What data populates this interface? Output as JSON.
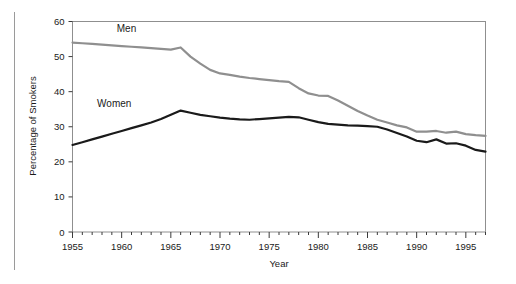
{
  "chart_data": {
    "type": "line",
    "title": "",
    "xlabel": "Year",
    "ylabel": "Percentage of Smokers",
    "xlim": [
      1955,
      1997
    ],
    "ylim": [
      0,
      60
    ],
    "xticks": [
      1955,
      1960,
      1965,
      1970,
      1975,
      1980,
      1985,
      1990,
      1995
    ],
    "xtick_labels": [
      "1955",
      "1960",
      "1965",
      "1970",
      "1975",
      "1980",
      "1985",
      "1990",
      "1995"
    ],
    "yticks": [
      0,
      10,
      20,
      30,
      40,
      50,
      60
    ],
    "ytick_labels": [
      "0",
      "10",
      "20",
      "30",
      "40",
      "50",
      "60"
    ],
    "minor_xtick_interval": 1,
    "grid": false,
    "legend": "inline-labels",
    "x": [
      1955,
      1956,
      1957,
      1958,
      1959,
      1960,
      1961,
      1962,
      1963,
      1964,
      1965,
      1966,
      1967,
      1968,
      1969,
      1970,
      1971,
      1972,
      1973,
      1974,
      1975,
      1976,
      1977,
      1978,
      1979,
      1980,
      1981,
      1982,
      1983,
      1984,
      1985,
      1986,
      1987,
      1988,
      1989,
      1990,
      1991,
      1992,
      1993,
      1994,
      1995,
      1996,
      1997
    ],
    "series": [
      {
        "name": "Men",
        "color": "#8f8f8f",
        "label_x": 1959.5,
        "label_y": 57.0,
        "values": [
          54.0,
          53.8,
          53.6,
          53.4,
          53.2,
          53.0,
          52.8,
          52.6,
          52.4,
          52.2,
          52.0,
          52.6,
          50.0,
          48.0,
          46.2,
          45.2,
          44.8,
          44.3,
          43.9,
          43.6,
          43.3,
          43.0,
          42.8,
          41.0,
          39.5,
          38.9,
          38.8,
          37.5,
          36.0,
          34.5,
          33.2,
          32.0,
          31.2,
          30.4,
          29.8,
          28.6,
          28.6,
          28.8,
          28.3,
          28.6,
          27.9,
          27.6,
          27.4
        ]
      },
      {
        "name": "Women",
        "color": "#1a1a1a",
        "label_x": 1957.5,
        "label_y": 35.5,
        "values": [
          24.8,
          25.6,
          26.4,
          27.2,
          28.0,
          28.8,
          29.6,
          30.4,
          31.2,
          32.2,
          33.4,
          34.6,
          34.0,
          33.4,
          33.0,
          32.6,
          32.3,
          32.1,
          32.0,
          32.2,
          32.4,
          32.6,
          32.8,
          32.7,
          32.0,
          31.3,
          30.8,
          30.6,
          30.4,
          30.3,
          30.2,
          30.0,
          29.2,
          28.2,
          27.2,
          26.0,
          25.6,
          26.4,
          25.2,
          25.3,
          24.6,
          23.4,
          22.9
        ]
      }
    ]
  },
  "axis": {
    "x_title": "Year",
    "y_title": "Percentage of Smokers"
  },
  "style": {
    "frame_color": "#8f8f8f",
    "men_color": "#8f8f8f",
    "women_color": "#1a1a1a",
    "background": "#ffffff"
  }
}
